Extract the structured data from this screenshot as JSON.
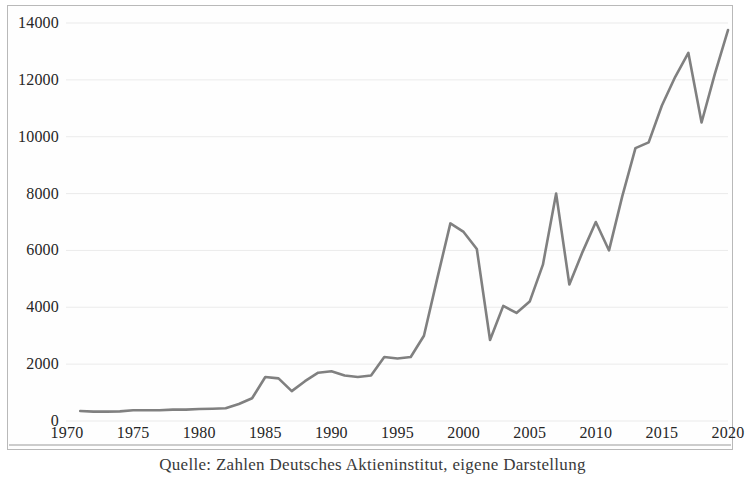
{
  "caption": "Quelle: Zahlen Deutsches Aktieninstitut, eigene Darstellung",
  "colors": {
    "line": "#808080",
    "grid": "#e9e9e9",
    "frame": "#b9b9b9",
    "background": "#fefefe",
    "text": "#262626"
  },
  "chart_data": {
    "type": "line",
    "title": "",
    "subtitle": "",
    "xlabel": "",
    "ylabel": "",
    "xlim": [
      1970,
      2020
    ],
    "ylim": [
      0,
      14000
    ],
    "grid": "horizontal",
    "legend": "none",
    "yticks": [
      0,
      2000,
      4000,
      6000,
      8000,
      10000,
      12000,
      14000
    ],
    "ytick_labels": [
      "0",
      "2000",
      "4000",
      "6000",
      "8000",
      "10000",
      "12000",
      "14000"
    ],
    "xticks": [
      1970,
      1975,
      1980,
      1985,
      1990,
      1995,
      2000,
      2005,
      2010,
      2015,
      2020
    ],
    "xtick_labels": [
      "1970",
      "1975",
      "1980",
      "1985",
      "1990",
      "1995",
      "2000",
      "2005",
      "2010",
      "2015",
      "2020"
    ],
    "series": [
      {
        "name": "Aktionaere",
        "x": [
          1971,
          1972,
          1973,
          1974,
          1975,
          1976,
          1977,
          1978,
          1979,
          1980,
          1981,
          1982,
          1983,
          1984,
          1985,
          1986,
          1987,
          1988,
          1989,
          1990,
          1991,
          1992,
          1993,
          1994,
          1995,
          1996,
          1997,
          1998,
          1999,
          2000,
          2001,
          2002,
          2003,
          2004,
          2005,
          2006,
          2007,
          2008,
          2009,
          2010,
          2011,
          2012,
          2013,
          2014,
          2015,
          2016,
          2017,
          2018,
          2019,
          2020
        ],
        "values": [
          350,
          330,
          330,
          340,
          380,
          380,
          380,
          400,
          400,
          420,
          430,
          450,
          600,
          800,
          1550,
          1500,
          1050,
          1400,
          1700,
          1750,
          1600,
          1550,
          1600,
          2250,
          2200,
          2250,
          3000,
          5000,
          6950,
          6650,
          6050,
          2850,
          4050,
          3800,
          4200,
          5500,
          8000,
          4800,
          5950,
          7000,
          6000,
          7900,
          9600,
          9800,
          11100,
          12100,
          12950,
          10500,
          12200,
          13750
        ]
      }
    ]
  },
  "axes_geometry": {
    "plot_left_px": 66,
    "plot_right_px": 727,
    "plot_top_px": 22,
    "plot_bottom_px": 420
  }
}
